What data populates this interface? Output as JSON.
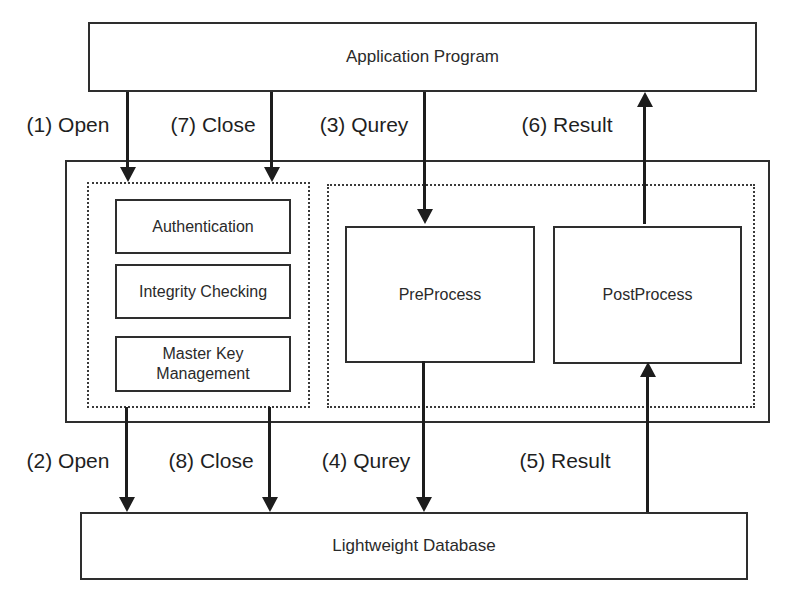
{
  "diagram": {
    "top_box": {
      "label": "Application Program"
    },
    "bottom_box": {
      "label": "Lightweight Database"
    },
    "middleware": {
      "security_group": {
        "items": [
          {
            "label": "Authentication"
          },
          {
            "label": "Integrity Checking"
          },
          {
            "label": "Master Key Management"
          }
        ]
      },
      "process_group": {
        "items": [
          {
            "label": "PreProcess"
          },
          {
            "label": "PostProcess"
          }
        ]
      }
    },
    "flows": [
      {
        "step": 1,
        "label": "(1) Open",
        "direction": "down"
      },
      {
        "step": 7,
        "label": "(7) Close",
        "direction": "down"
      },
      {
        "step": 3,
        "label": "(3) Qurey",
        "direction": "down"
      },
      {
        "step": 6,
        "label": "(6) Result",
        "direction": "up"
      },
      {
        "step": 2,
        "label": "(2) Open",
        "direction": "down"
      },
      {
        "step": 8,
        "label": "(8) Close",
        "direction": "down"
      },
      {
        "step": 4,
        "label": "(4) Qurey",
        "direction": "down"
      },
      {
        "step": 5,
        "label": "(5) Result",
        "direction": "up"
      }
    ],
    "colors": {
      "line": "#2e2e2e",
      "arrow": "#1d1d1d",
      "background": "#ffffff",
      "text": "#2a2a2a"
    }
  }
}
